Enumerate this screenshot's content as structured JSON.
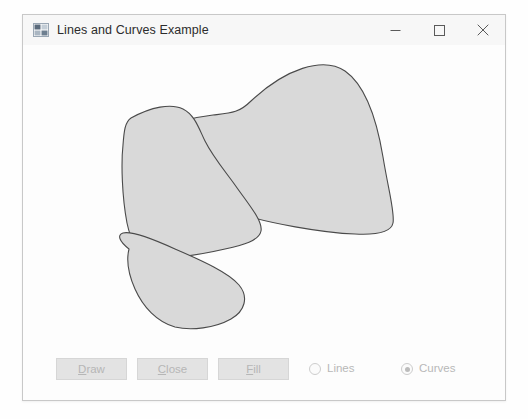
{
  "window": {
    "title": "Lines and Curves Example",
    "icon": "winforms-app-icon",
    "buttons": {
      "minimize": "minimize-icon",
      "maximize": "maximize-icon",
      "close": "close-icon"
    }
  },
  "toolbar": {
    "draw": {
      "label": "Draw",
      "mnemonic": "D",
      "enabled": false
    },
    "close": {
      "label": "Close",
      "mnemonic": "C",
      "enabled": false
    },
    "fill": {
      "label": "Fill",
      "mnemonic": "F",
      "enabled": false
    }
  },
  "mode": {
    "lines": {
      "label": "Lines",
      "selected": false
    },
    "curves": {
      "label": "Curves",
      "selected": true
    }
  },
  "canvas": {
    "fill_color": "#d9d9d9",
    "stroke_color": "#4a4a4a",
    "background": "#fdfdfd",
    "fill_rule": "evenodd",
    "shape_path": "M 255,44 C 290,46 318,78 333,110 C 349,143 358,175 355,198 C 352,222 336,232 310,231 C 278,230 243,218 215,200 C 190,184 176,166 176,150 C 176,130 196,108 222,86 C 238,72 246,60 255,44 Z",
    "description": "closed spline curve with self-intersections, alternate fill"
  }
}
